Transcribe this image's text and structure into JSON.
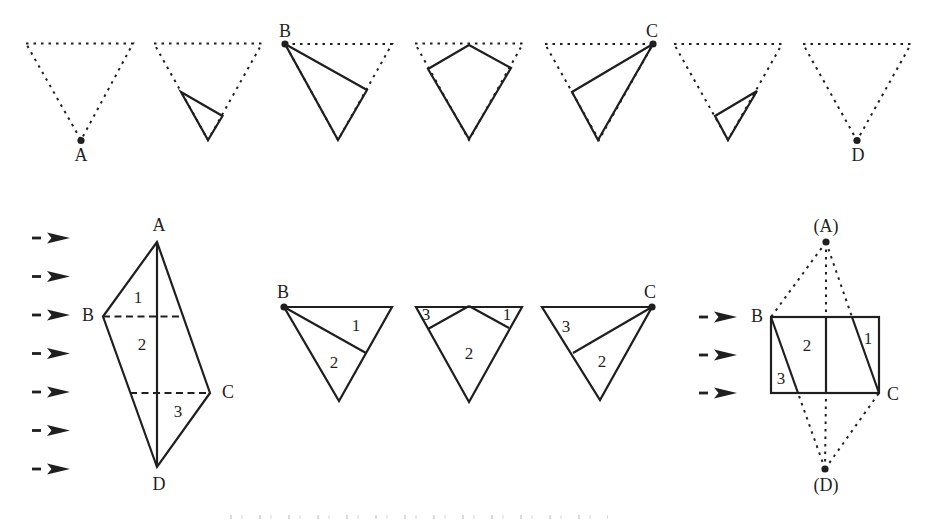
{
  "colors": {
    "ink": "#1f1f1f",
    "paper": "#ffffff"
  },
  "top_row": {
    "frame_count": 7,
    "label_a": "A",
    "label_b": "B",
    "label_c": "C",
    "label_d": "D"
  },
  "left_arrow_count": 7,
  "right_arrow_count": 3,
  "rhombus": {
    "label_a": "A",
    "label_b": "B",
    "label_c": "C",
    "label_d": "D",
    "region_1": "1",
    "region_2": "2",
    "region_3": "3"
  },
  "mid_triangles": {
    "left": {
      "label_b": "B",
      "region_1": "1",
      "region_2": "2"
    },
    "center": {
      "region_3": "3",
      "region_1": "1",
      "region_2": "2"
    },
    "right": {
      "label_c": "C",
      "region_3": "3",
      "region_2": "2"
    }
  },
  "square": {
    "label_top": "(A)",
    "label_left": "B",
    "label_right": "C",
    "label_bottom": "(D)",
    "region_1": "1",
    "region_2": "2",
    "region_3": "3"
  }
}
